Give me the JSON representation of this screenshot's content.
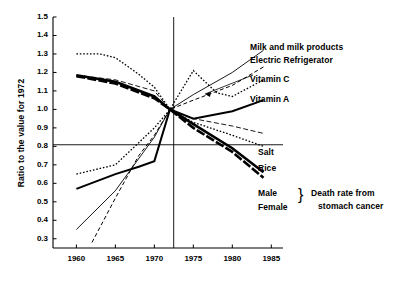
{
  "chart_data": {
    "type": "line",
    "title": "",
    "xlabel": "",
    "ylabel": "Ratio to the value for 1972",
    "xlim": [
      1957,
      1986.5
    ],
    "ylim": [
      0.25,
      1.5
    ],
    "xticks": [
      1960,
      1965,
      1970,
      1975,
      1980,
      1985
    ],
    "xtick_labels": [
      "1960",
      "1965",
      "1970",
      "1975",
      "1980",
      "1985"
    ],
    "yticks": [
      0.3,
      0.4,
      0.5,
      0.6,
      0.7,
      0.8,
      0.9,
      1.0,
      1.1,
      1.2,
      1.3,
      1.4,
      1.5
    ],
    "ytick_labels": [
      "0.3",
      "0.4",
      "0.5",
      "0.6",
      "0.7",
      "0.8",
      "0.9",
      "1.0",
      "1.1",
      "1.2",
      "1.3",
      "1.4",
      "1.5"
    ],
    "grid": false,
    "legend_position": "right-inline-labels",
    "reference_lines": [
      {
        "name": "horizontal-unity-line",
        "axis": "y",
        "value": 1.0
      },
      {
        "name": "vertical-1972-line",
        "axis": "x",
        "value": 1972
      }
    ],
    "series": [
      {
        "name": "Milk and milk products",
        "style": "thin-solid",
        "x": [
          1960,
          1965,
          1970,
          1972,
          1975,
          1980,
          1984
        ],
        "values": [
          0.35,
          0.56,
          0.85,
          1.0,
          1.08,
          1.2,
          1.32
        ]
      },
      {
        "name": "Electric Refrigerator",
        "style": "dashed",
        "x": [
          1962,
          1965,
          1968,
          1970,
          1972,
          1975,
          1980,
          1984
        ],
        "values": [
          0.28,
          0.52,
          0.75,
          0.86,
          1.0,
          1.05,
          1.13,
          1.23
        ]
      },
      {
        "name": "Vitamin C",
        "style": "dotted",
        "x": [
          1960,
          1965,
          1968,
          1970,
          1972,
          1975,
          1978,
          1980,
          1984
        ],
        "values": [
          0.65,
          0.7,
          0.82,
          0.9,
          1.0,
          1.21,
          1.09,
          1.07,
          1.16
        ]
      },
      {
        "name": "Vitamin A",
        "style": "thick-solid",
        "x": [
          1960,
          1965,
          1968,
          1970,
          1972,
          1975,
          1980,
          1984
        ],
        "values": [
          0.57,
          0.65,
          0.69,
          0.72,
          1.0,
          0.95,
          0.99,
          1.05
        ]
      },
      {
        "name": "Salt",
        "style": "thin-dashed",
        "x": [
          1960,
          1965,
          1970,
          1972,
          1975,
          1980,
          1984
        ],
        "values": [
          1.185,
          1.16,
          1.1,
          1.0,
          0.95,
          0.91,
          0.87
        ]
      },
      {
        "name": "Rice",
        "style": "dotted",
        "x": [
          1960,
          1963,
          1965,
          1968,
          1970,
          1972,
          1975,
          1980,
          1984
        ],
        "values": [
          1.3,
          1.3,
          1.28,
          1.19,
          1.12,
          1.0,
          0.93,
          0.86,
          0.8
        ]
      },
      {
        "name": "Male",
        "style": "very-thick-solid",
        "x": [
          1960,
          1965,
          1970,
          1972,
          1975,
          1980,
          1984
        ],
        "values": [
          1.185,
          1.15,
          1.07,
          1.0,
          0.92,
          0.79,
          0.66
        ]
      },
      {
        "name": "Female",
        "style": "very-thick-dashed",
        "x": [
          1960,
          1965,
          1970,
          1972,
          1975,
          1980,
          1984
        ],
        "values": [
          1.18,
          1.14,
          1.06,
          1.0,
          0.9,
          0.77,
          0.63
        ]
      }
    ],
    "annotations": [
      {
        "name": "death-rate-brace-label",
        "text": "Death rate from\nstomach cancer",
        "applies_to": [
          "Male",
          "Female"
        ]
      }
    ]
  },
  "labels": {
    "milk": "Milk and milk products",
    "refrigerator": "Electric Refrigerator",
    "vitamin_c": "Vitamin C",
    "vitamin_a": "Vitamin A",
    "salt": "Salt",
    "rice": "Rice",
    "male": "Male",
    "female": "Female",
    "brace": "}",
    "death_rate_line1": "Death rate from",
    "death_rate_line2": "stomach cancer"
  },
  "axes": {
    "y_title": "Ratio to the value for 1972",
    "y_ticks": [
      "1.5",
      "1.4",
      "1.3",
      "1.2",
      "1.1",
      "1.0",
      "0.9",
      "0.8",
      "0.7",
      "0.6",
      "0.5",
      "0.4",
      "0.3"
    ],
    "x_ticks": [
      "1960",
      "1965",
      "1970",
      "1975",
      "1980",
      "1985"
    ]
  },
  "colors": {
    "ink": "#000000",
    "background": "#ffffff"
  }
}
